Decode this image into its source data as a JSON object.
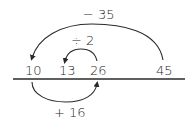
{
  "diagram": {
    "type": "number-line-operations",
    "number_line": {
      "ticks": [
        {
          "label": "10",
          "x": 32
        },
        {
          "label": "13",
          "x": 66
        },
        {
          "label": "26",
          "x": 97
        },
        {
          "label": "45",
          "x": 163
        }
      ]
    },
    "operations": [
      {
        "label": "− 35",
        "from": "45",
        "to": "10",
        "position": "above-outer"
      },
      {
        "label": "÷ 2",
        "from": "26",
        "to": "13",
        "position": "above-inner"
      },
      {
        "label": "+ 16",
        "from": "10",
        "to": "26",
        "position": "below"
      }
    ],
    "colors": {
      "stroke": "#2a2a2a",
      "text": "#2a2a2a",
      "background": "#ffffff"
    }
  }
}
